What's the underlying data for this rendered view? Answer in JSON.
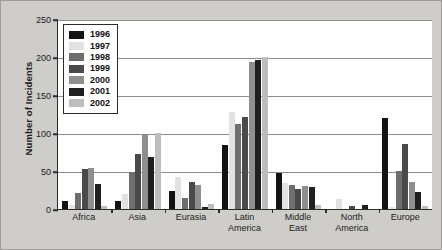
{
  "chart_data": {
    "type": "bar",
    "title": "",
    "xlabel": "",
    "ylabel": "Number of Incidents",
    "ylim": [
      0,
      250
    ],
    "yticks": [
      0,
      50,
      100,
      150,
      200,
      250
    ],
    "grid": true,
    "legend_position": "top-left-inside",
    "categories": [
      "Africa",
      "Asia",
      "Eurasia",
      "Latin\nAmerica",
      "Middle\nEast",
      "North\nAmerica",
      "Europe"
    ],
    "series": [
      {
        "name": "1996",
        "color": "#131313",
        "values": [
          11,
          11,
          24,
          84,
          47,
          0,
          120
        ]
      },
      {
        "name": "1997",
        "color": "#e2e2e2",
        "values": [
          5,
          20,
          42,
          128,
          34,
          13,
          2
        ]
      },
      {
        "name": "1998",
        "color": "#6e6e6e",
        "values": [
          21,
          49,
          15,
          112,
          31,
          0,
          50
        ]
      },
      {
        "name": "1999",
        "color": "#4a4a4a",
        "values": [
          52,
          72,
          36,
          121,
          26,
          4,
          85
        ]
      },
      {
        "name": "2000",
        "color": "#8e8e8e",
        "values": [
          54,
          99,
          31,
          193,
          30,
          0,
          35
        ]
      },
      {
        "name": "2001",
        "color": "#1f1f1f",
        "values": [
          33,
          68,
          3,
          196,
          29,
          5,
          22
        ]
      },
      {
        "name": "2002",
        "color": "#bdbdbd",
        "values": [
          4,
          100,
          7,
          200,
          5,
          0,
          4
        ]
      }
    ]
  }
}
